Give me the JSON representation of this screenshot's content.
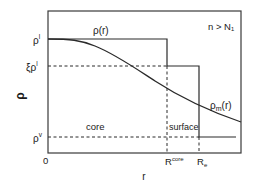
{
  "figure": {
    "condition_label": "n > N₁",
    "y_axis_label": "ρ",
    "x_axis_label": "r",
    "y_ticks": {
      "rho_l": {
        "base": "ρ",
        "sup": "l"
      },
      "xi_rho_l": {
        "base": "ξρ",
        "sup": "l"
      },
      "rho_v": {
        "base": "ρ",
        "sup": "v"
      }
    },
    "x_ticks": {
      "origin": "0",
      "r_core": {
        "base": "R",
        "sup": "core"
      },
      "r_e": {
        "base": "R",
        "sub": "e"
      }
    },
    "curves": {
      "step_profile": {
        "base": "ρ(r)"
      },
      "smooth_profile": {
        "base": "ρ",
        "sub": "m",
        "tail": "(r)"
      }
    },
    "regions": {
      "core": "core",
      "surface": "surface"
    },
    "colors": {
      "line": "#2a2a2a",
      "frame": "#3a3a3a",
      "text": "#1a1a1a"
    }
  }
}
